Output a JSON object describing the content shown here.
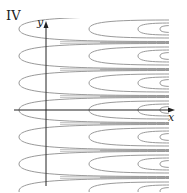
{
  "figure": {
    "panel_label": "IV",
    "x_axis_label": "x",
    "y_axis_label": "y",
    "curve_color": "#9a9a9a",
    "axis_color": "#222222"
  },
  "chart_data": {
    "type": "line",
    "title": "IV",
    "xlabel": "x",
    "ylabel": "y",
    "row_centers_px": [
      56,
      83,
      110,
      137,
      164
    ],
    "vertex_x_px": [
      19,
      89,
      138,
      160,
      172
    ],
    "grid": false,
    "legend": null
  }
}
